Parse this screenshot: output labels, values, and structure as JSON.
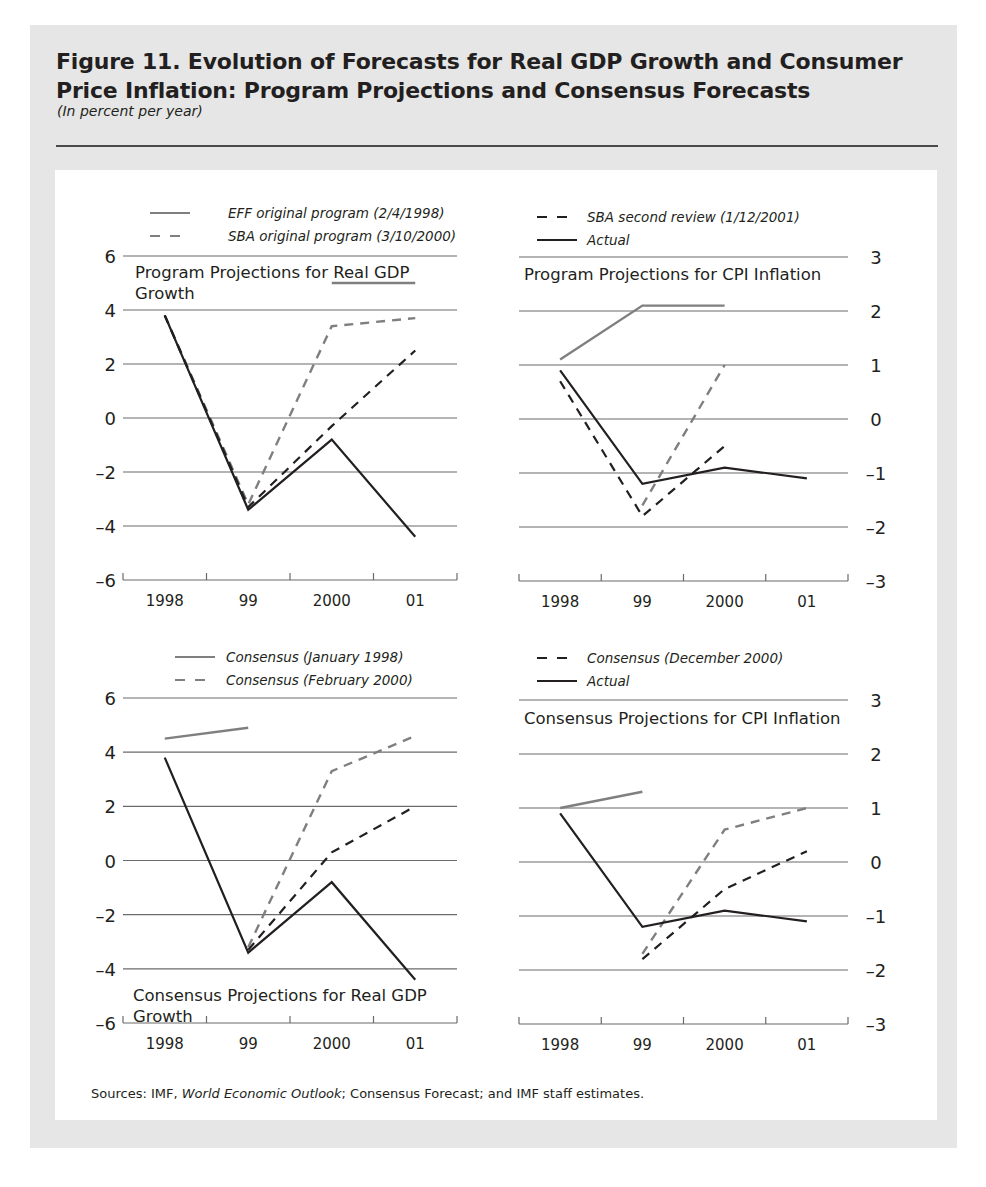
{
  "figure": {
    "title": "Figure 11. Evolution of Forecasts for Real GDP Growth and Consumer Price Inflation: Program Projections and Consensus Forecasts",
    "title_line1": "Figure 11. Evolution of Forecasts for Real GDP Growth and Consumer",
    "title_line2": "Price Inflation: Program Projections and Consensus Forecasts",
    "subtitle": "(In percent per year)",
    "sources_prefix": "Sources: IMF, ",
    "sources_italic": "World Economic Outlook",
    "sources_suffix": "; Consensus Forecast; and IMF staff estimates."
  },
  "colors": {
    "frame": "#e6e6e6",
    "panel": "#ffffff",
    "gray_series": "#7f7f7f",
    "black_series": "#231f20",
    "grid": "#6b6b6b"
  },
  "chart_data": [
    {
      "id": "program-gdp",
      "type": "line",
      "title": "Program Projections for Real GDP Growth",
      "title_lines": [
        "Program Projections for Real GDP",
        "Growth"
      ],
      "categories": [
        "1998",
        "99",
        "2000",
        "01"
      ],
      "ylabel": "In percent per year",
      "ylim": [
        -6,
        6
      ],
      "yticks": [
        6,
        4,
        2,
        0,
        -2,
        -4,
        -6
      ],
      "ytick_labels": [
        "6",
        "4",
        "2",
        "0",
        "–2",
        "–4",
        "–6"
      ],
      "yaxis_side": "left",
      "grid": true,
      "legend": [
        {
          "label": "EFF original program (2/4/1998)",
          "style": "solid",
          "color": "#7f7f7f"
        },
        {
          "label": "SBA original program (3/10/2000)",
          "style": "dashed",
          "color": "#7f7f7f"
        }
      ],
      "series": [
        {
          "name": "EFF original program (2/4/1998)",
          "style": "solid",
          "color": "#7f7f7f",
          "values": [
            4.0,
            null,
            5.0,
            5.0
          ]
        },
        {
          "name": "SBA original program (3/10/2000)",
          "style": "dashed",
          "color": "#7f7f7f",
          "values": [
            3.8,
            -3.2,
            3.4,
            3.7
          ]
        },
        {
          "name": "SBA second review (1/12/2001)",
          "style": "dashed",
          "color": "#231f20",
          "values": [
            3.8,
            -3.3,
            -0.3,
            2.5
          ]
        },
        {
          "name": "Actual",
          "style": "solid",
          "color": "#231f20",
          "values": [
            3.8,
            -3.4,
            -0.8,
            -4.4
          ]
        }
      ]
    },
    {
      "id": "program-cpi",
      "type": "line",
      "title": "Program Projections for CPI Inflation",
      "title_lines": [
        "Program Projections for CPI Inflation"
      ],
      "categories": [
        "1998",
        "99",
        "2000",
        "01"
      ],
      "ylabel": "In percent per year",
      "ylim": [
        -3,
        3
      ],
      "yticks": [
        3,
        2,
        1,
        0,
        -1,
        -2,
        -3
      ],
      "ytick_labels": [
        "3",
        "2",
        "1",
        "0",
        "–1",
        "–2",
        "–3"
      ],
      "yaxis_side": "right",
      "grid": true,
      "legend": [
        {
          "label": "SBA second review (1/12/2001)",
          "style": "dashed",
          "color": "#231f20"
        },
        {
          "label": "Actual",
          "style": "solid",
          "color": "#231f20"
        }
      ],
      "series": [
        {
          "name": "EFF original program (2/4/1998)",
          "style": "solid",
          "color": "#7f7f7f",
          "values": [
            1.1,
            2.1,
            2.1,
            null
          ]
        },
        {
          "name": "SBA original program (3/10/2000)",
          "style": "dashed",
          "color": "#7f7f7f",
          "values": [
            null,
            -1.6,
            1.0,
            null
          ]
        },
        {
          "name": "SBA second review (1/12/2001)",
          "style": "dashed",
          "color": "#231f20",
          "values": [
            0.7,
            -1.8,
            -0.5,
            null
          ]
        },
        {
          "name": "Actual",
          "style": "solid",
          "color": "#231f20",
          "values": [
            0.9,
            -1.2,
            -0.9,
            -1.1
          ]
        }
      ]
    },
    {
      "id": "consensus-gdp",
      "type": "line",
      "title": "Consensus Projections for Real GDP Growth",
      "title_lines": [
        "Consensus Projections for Real GDP",
        "Growth"
      ],
      "categories": [
        "1998",
        "99",
        "2000",
        "01"
      ],
      "ylabel": "In percent per year",
      "ylim": [
        -6,
        6
      ],
      "yticks": [
        6,
        4,
        2,
        0,
        -2,
        -4,
        -6
      ],
      "ytick_labels": [
        "6",
        "4",
        "2",
        "0",
        "–2",
        "–4",
        "–6"
      ],
      "yaxis_side": "left",
      "grid": true,
      "legend": [
        {
          "label": "Consensus (January 1998)",
          "style": "solid",
          "color": "#7f7f7f"
        },
        {
          "label": "Consensus (February 2000)",
          "style": "dashed",
          "color": "#7f7f7f"
        }
      ],
      "series": [
        {
          "name": "Consensus (January 1998)",
          "style": "solid",
          "color": "#7f7f7f",
          "values": [
            4.5,
            4.9,
            null,
            null
          ]
        },
        {
          "name": "Consensus (February 2000)",
          "style": "dashed",
          "color": "#7f7f7f",
          "values": [
            null,
            -3.2,
            3.3,
            4.6
          ]
        },
        {
          "name": "Consensus (December 2000)",
          "style": "dashed",
          "color": "#231f20",
          "values": [
            null,
            -3.3,
            0.3,
            2.0
          ]
        },
        {
          "name": "Actual",
          "style": "solid",
          "color": "#231f20",
          "values": [
            3.8,
            -3.4,
            -0.8,
            -4.4
          ]
        }
      ]
    },
    {
      "id": "consensus-cpi",
      "type": "line",
      "title": "Consensus Projections for CPI Inflation",
      "title_lines": [
        "Consensus Projections for CPI Inflation"
      ],
      "categories": [
        "1998",
        "99",
        "2000",
        "01"
      ],
      "ylabel": "In percent per year",
      "ylim": [
        -3,
        3
      ],
      "yticks": [
        3,
        2,
        1,
        0,
        -1,
        -2,
        -3
      ],
      "ytick_labels": [
        "3",
        "2",
        "1",
        "0",
        "–1",
        "–2",
        "–3"
      ],
      "yaxis_side": "right",
      "grid": true,
      "legend": [
        {
          "label": "Consensus (December 2000)",
          "style": "dashed",
          "color": "#231f20"
        },
        {
          "label": "Actual",
          "style": "solid",
          "color": "#231f20"
        }
      ],
      "series": [
        {
          "name": "Consensus (January 1998)",
          "style": "solid",
          "color": "#7f7f7f",
          "values": [
            1.0,
            1.3,
            null,
            null
          ]
        },
        {
          "name": "Consensus (February 2000)",
          "style": "dashed",
          "color": "#7f7f7f",
          "values": [
            null,
            -1.7,
            0.6,
            1.0
          ]
        },
        {
          "name": "Consensus (December 2000)",
          "style": "dashed",
          "color": "#231f20",
          "values": [
            null,
            -1.8,
            -0.5,
            0.2
          ]
        },
        {
          "name": "Actual",
          "style": "solid",
          "color": "#231f20",
          "values": [
            0.9,
            -1.2,
            -0.9,
            -1.1
          ]
        }
      ]
    }
  ],
  "layout": {
    "panels": [
      {
        "plot_left": 123,
        "plot_right": 457,
        "y_top": 256,
        "y_bottom": 580,
        "label_x": 116,
        "title_x": 135,
        "title_y": 278,
        "legend_x": 150,
        "legend_y": 218,
        "legend_text_x": 228
      },
      {
        "plot_left": 519,
        "plot_right": 848,
        "y_top": 257,
        "y_bottom": 581,
        "label_x": 876,
        "title_x": 524,
        "title_y": 280,
        "legend_x": 537,
        "legend_y": 222,
        "legend_text_x": 587
      },
      {
        "plot_left": 123,
        "plot_right": 457,
        "y_top": 698,
        "y_bottom": 1023,
        "label_x": 116,
        "title_x": 133,
        "title_y": 1001,
        "legend_x": 175,
        "legend_y": 662,
        "legend_text_x": 226
      },
      {
        "plot_left": 519,
        "plot_right": 848,
        "y_top": 700,
        "y_bottom": 1024,
        "label_x": 876,
        "title_x": 524,
        "title_y": 724,
        "legend_x": 537,
        "legend_y": 663,
        "legend_text_x": 587
      }
    ]
  }
}
